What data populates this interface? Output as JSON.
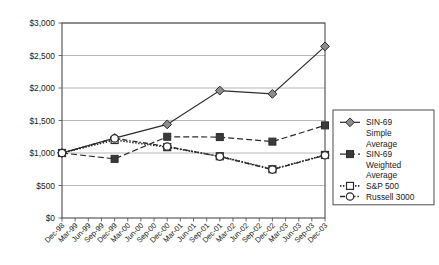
{
  "chart_data": {
    "type": "line",
    "title": "",
    "subtitle": "",
    "xlabel": "",
    "ylabel": "",
    "ylim": [
      0,
      3000
    ],
    "ytick_labels": [
      "$0",
      "$500",
      "$1,000",
      "$1,500",
      "$2,000",
      "$2,500",
      "$3,000"
    ],
    "ytick_values": [
      0,
      500,
      1000,
      1500,
      2000,
      2500,
      3000
    ],
    "grid": true,
    "grid_axis": "y",
    "legend_position": "right",
    "x_tick_labels": [
      "Dec-98",
      "Mar-99",
      "Jun-99",
      "Sep-99",
      "Dec-99",
      "Mar-00",
      "Jun-00",
      "Sep-00",
      "Dec-00",
      "Mar-01",
      "Jun-01",
      "Sep-01",
      "Dec-01",
      "Mar-02",
      "Jun-02",
      "Sep-02",
      "Dec-02",
      "Mar-03",
      "Jun-03",
      "Sep-03",
      "Dec-03"
    ],
    "x": [
      "Dec-98",
      "Dec-99",
      "Dec-00",
      "Dec-01",
      "Dec-02",
      "Dec-03"
    ],
    "x_tick_indices": [
      0,
      4,
      8,
      12,
      16,
      20
    ],
    "series": [
      {
        "name": "SIN-69 Simple Average",
        "marker": "diamond",
        "line_style": "solid",
        "color": "#2b2b2b",
        "marker_fill": "#8c8c8c",
        "values": [
          1000,
          1230,
          1440,
          1960,
          1910,
          2640
        ]
      },
      {
        "name": "SIN-69 Weighted Average",
        "marker": "square-filled",
        "line_style": "dashed",
        "color": "#2b2b2b",
        "marker_fill": "#3a3a3a",
        "values": [
          1000,
          910,
          1250,
          1245,
          1175,
          1425
        ]
      },
      {
        "name": "S&P 500",
        "marker": "square-open",
        "line_style": "dotted",
        "color": "#2b2b2b",
        "marker_fill": "#ffffff",
        "values": [
          1000,
          1200,
          1090,
          950,
          750,
          970
        ]
      },
      {
        "name": "Russell 3000",
        "marker": "circle-open",
        "line_style": "dashdot",
        "color": "#2b2b2b",
        "marker_fill": "#ffffff",
        "values": [
          1000,
          1225,
          1100,
          945,
          745,
          965
        ]
      }
    ]
  },
  "legend": {
    "entries": [
      {
        "label_lines": [
          "SIN-69",
          "Simple",
          "Average"
        ],
        "key": "sin69-simple-average"
      },
      {
        "label_lines": [
          "SIN-69",
          "Weighted",
          "Average"
        ],
        "key": "sin69-weighted-average"
      },
      {
        "label_lines": [
          "S&P 500"
        ],
        "key": "sp-500"
      },
      {
        "label_lines": [
          "Russell 3000"
        ],
        "key": "russell-3000"
      }
    ]
  }
}
